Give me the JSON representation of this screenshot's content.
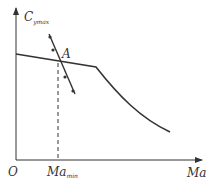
{
  "diagram": {
    "y_axis_label": "C",
    "y_axis_subscript": "ymax",
    "x_axis_label": "Ma",
    "origin_label": "O",
    "point_label": "A",
    "marker_label": "Ma",
    "marker_subscript": "min",
    "colors": {
      "line": "#333333",
      "background": "#ffffff"
    }
  }
}
